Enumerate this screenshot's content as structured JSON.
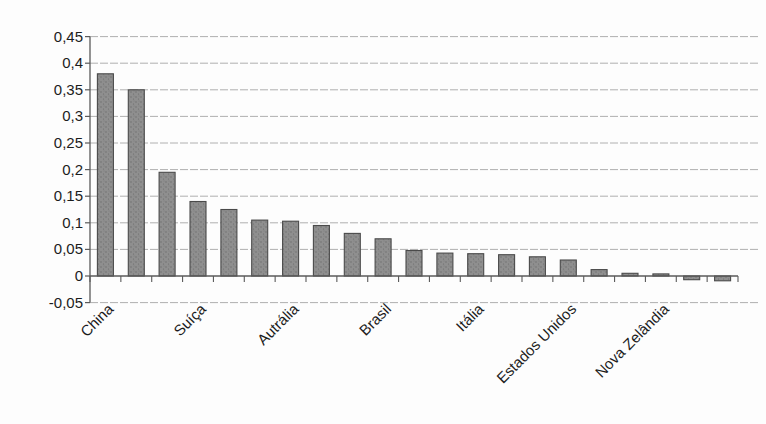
{
  "chart_data": {
    "type": "bar",
    "title": "",
    "xlabel": "",
    "ylabel": "",
    "legend": "none",
    "grid": "horizontal-dashed",
    "decimal_separator": ",",
    "ylim": [
      -0.05,
      0.45
    ],
    "num_bars": 21,
    "values": [
      0.38,
      0.35,
      0.195,
      0.14,
      0.125,
      0.105,
      0.103,
      0.095,
      0.08,
      0.07,
      0.048,
      0.043,
      0.042,
      0.04,
      0.036,
      0.03,
      0.012,
      0.005,
      0.004,
      -0.007,
      -0.009
    ],
    "x_tick_labels": [
      "China",
      "Suíça",
      "Autrália",
      "Brasil",
      "Itália",
      "Estados Unidos",
      "Nova Zelândia"
    ],
    "x_tick_label_bar_indices": [
      0,
      3,
      6,
      9,
      12,
      15,
      18
    ],
    "y_tick_labels": [
      "0,45",
      "0,4",
      "0,35",
      "0,3",
      "0,25",
      "0,2",
      "0,15",
      "0,1",
      "0,05",
      "0",
      "-0,05"
    ],
    "y_tick_values": [
      0.45,
      0.4,
      0.35,
      0.3,
      0.25,
      0.2,
      0.15,
      0.1,
      0.05,
      0,
      -0.05
    ],
    "colors": {
      "bar_fill": "#8f8f8f",
      "bar_speckle": "#6b6b6b",
      "bar_border": "#4a4a4a",
      "gridline": "#a8a8a8",
      "axis_line": "#5a5a5a",
      "tick_label": "#1c1c1c",
      "background": "#fdfdfd"
    }
  }
}
